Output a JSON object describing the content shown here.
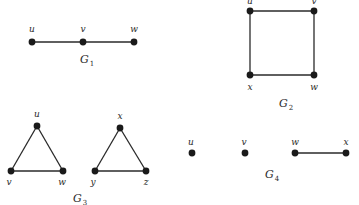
{
  "graphs": [
    {
      "name": "G",
      "sub": "1",
      "label_pos": [
        80,
        63
      ],
      "vertices": [
        {
          "id": "u",
          "x": 32,
          "y": 42,
          "lx": 32,
          "ly": 32
        },
        {
          "id": "v",
          "x": 83,
          "y": 42,
          "lx": 83,
          "ly": 32
        },
        {
          "id": "w",
          "x": 134,
          "y": 42,
          "lx": 134,
          "ly": 32
        }
      ],
      "edges": [
        [
          "u",
          "v"
        ],
        [
          "v",
          "w"
        ]
      ]
    },
    {
      "name": "G",
      "sub": "2",
      "label_pos": [
        279,
        107
      ],
      "vertices": [
        {
          "id": "u",
          "x": 250,
          "y": 11,
          "lx": 250,
          "ly": 4
        },
        {
          "id": "v",
          "x": 314,
          "y": 11,
          "lx": 314,
          "ly": 4
        },
        {
          "id": "x",
          "x": 250,
          "y": 75,
          "lx": 250,
          "ly": 90
        },
        {
          "id": "w",
          "x": 314,
          "y": 75,
          "lx": 314,
          "ly": 90
        }
      ],
      "edges": [
        [
          "u",
          "v"
        ],
        [
          "v",
          "w"
        ],
        [
          "w",
          "x"
        ],
        [
          "x",
          "u"
        ]
      ]
    },
    {
      "name": "G",
      "sub": "3",
      "label_pos": [
        73,
        202
      ],
      "vertices": [
        {
          "id": "u",
          "x": 37,
          "y": 126,
          "lx": 37,
          "ly": 117
        },
        {
          "id": "v",
          "x": 11,
          "y": 171,
          "lx": 9,
          "ly": 185
        },
        {
          "id": "w",
          "x": 63,
          "y": 171,
          "lx": 62,
          "ly": 185
        },
        {
          "id": "x",
          "x": 120,
          "y": 128,
          "lx": 120,
          "ly": 119
        },
        {
          "id": "y",
          "x": 95,
          "y": 171,
          "lx": 93,
          "ly": 185
        },
        {
          "id": "z",
          "x": 146,
          "y": 171,
          "lx": 146,
          "ly": 185
        }
      ],
      "edges": [
        [
          "u",
          "v"
        ],
        [
          "v",
          "w"
        ],
        [
          "w",
          "u"
        ],
        [
          "x",
          "y"
        ],
        [
          "y",
          "z"
        ],
        [
          "z",
          "x"
        ]
      ]
    },
    {
      "name": "G",
      "sub": "4",
      "label_pos": [
        265,
        178
      ],
      "vertices": [
        {
          "id": "u",
          "x": 192,
          "y": 153,
          "lx": 191,
          "ly": 145
        },
        {
          "id": "v",
          "x": 245,
          "y": 153,
          "lx": 244,
          "ly": 145
        },
        {
          "id": "w",
          "x": 295,
          "y": 153,
          "lx": 295,
          "ly": 145
        },
        {
          "id": "x",
          "x": 346,
          "y": 153,
          "lx": 346,
          "ly": 145
        }
      ],
      "edges": [
        [
          "w",
          "x"
        ]
      ]
    }
  ],
  "style": {
    "node_color": "#1a1a1a",
    "edge_color": "#2a2a2a",
    "background": "#ffffff"
  }
}
